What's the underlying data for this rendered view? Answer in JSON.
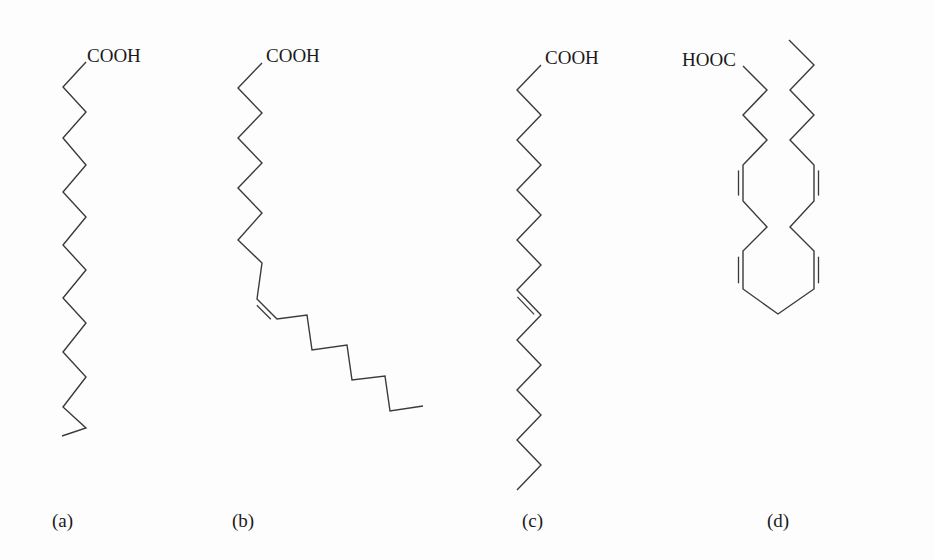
{
  "figure": {
    "structures": [
      {
        "id": "a",
        "label": "(a)",
        "label_pos": [
          52,
          511
        ],
        "group": "COOH",
        "group_pos": [
          87,
          46
        ],
        "chain": [
          [
            86,
            62
          ],
          [
            63,
            87
          ],
          [
            86,
            112
          ],
          [
            63,
            138
          ],
          [
            86,
            165
          ],
          [
            63,
            192
          ],
          [
            86,
            217
          ],
          [
            63,
            245
          ],
          [
            86,
            270
          ],
          [
            63,
            298
          ],
          [
            86,
            323
          ],
          [
            63,
            352
          ],
          [
            86,
            377
          ],
          [
            63,
            407
          ],
          [
            86,
            428
          ],
          [
            62,
            436
          ]
        ],
        "double_bonds": []
      },
      {
        "id": "b",
        "label": "(b)",
        "label_pos": [
          232,
          511
        ],
        "group": "COOH",
        "group_pos": [
          266,
          46
        ],
        "chain": [
          [
            262,
            63
          ],
          [
            238,
            88
          ],
          [
            262,
            113
          ],
          [
            238,
            138
          ],
          [
            262,
            163
          ],
          [
            238,
            188
          ],
          [
            262,
            213
          ],
          [
            238,
            240
          ],
          [
            262,
            263
          ],
          [
            257,
            299
          ],
          [
            277,
            319
          ],
          [
            307,
            315
          ],
          [
            312,
            350
          ],
          [
            347,
            345
          ],
          [
            352,
            380
          ],
          [
            385,
            376
          ],
          [
            390,
            411
          ],
          [
            423,
            406
          ]
        ],
        "double_bonds": [
          [
            [
              257,
              299
            ],
            [
              277,
              319
            ],
            "right"
          ]
        ]
      },
      {
        "id": "c",
        "label": "(c)",
        "label_pos": [
          522,
          511
        ],
        "group": "COOH",
        "group_pos": [
          545,
          48
        ],
        "chain": [
          [
            541,
            65
          ],
          [
            517,
            90
          ],
          [
            541,
            115
          ],
          [
            517,
            140
          ],
          [
            541,
            165
          ],
          [
            517,
            190
          ],
          [
            541,
            215
          ],
          [
            517,
            240
          ],
          [
            541,
            265
          ],
          [
            517,
            290
          ],
          [
            541,
            315
          ],
          [
            517,
            340
          ],
          [
            541,
            365
          ],
          [
            517,
            390
          ],
          [
            541,
            415
          ],
          [
            517,
            440
          ],
          [
            541,
            465
          ],
          [
            517,
            490
          ]
        ],
        "double_bonds": [
          [
            [
              517,
              290
            ],
            [
              541,
              315
            ],
            "right"
          ]
        ]
      },
      {
        "id": "d",
        "label": "(d)",
        "label_pos": [
          767,
          511
        ],
        "group": "HOOC",
        "group_pos": [
          682,
          50
        ],
        "chain": [
          [
            743,
            66
          ],
          [
            767,
            90
          ],
          [
            743,
            115
          ],
          [
            767,
            140
          ],
          [
            743,
            165
          ],
          [
            743,
            201
          ],
          [
            767,
            227
          ],
          [
            743,
            251
          ],
          [
            743,
            289
          ],
          [
            778,
            314
          ],
          [
            814,
            289
          ],
          [
            814,
            251
          ],
          [
            790,
            227
          ],
          [
            814,
            201
          ],
          [
            814,
            165
          ],
          [
            790,
            140
          ],
          [
            814,
            115
          ],
          [
            790,
            90
          ],
          [
            814,
            65
          ],
          [
            789,
            40
          ]
        ],
        "double_bonds": [
          [
            [
              743,
              165
            ],
            [
              743,
              201
            ],
            "right"
          ],
          [
            [
              743,
              251
            ],
            [
              743,
              289
            ],
            "right"
          ],
          [
            [
              814,
              251
            ],
            [
              814,
              289
            ],
            "left"
          ],
          [
            [
              814,
              165
            ],
            [
              814,
              201
            ],
            "left"
          ]
        ]
      }
    ]
  }
}
